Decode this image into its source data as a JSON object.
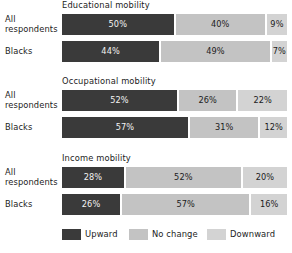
{
  "chart_data": {
    "type": "bar",
    "orientation": "horizontal",
    "stacked": true,
    "percent_stacked": true,
    "title": "",
    "xlabel": "",
    "ylabel": "",
    "xlim": [
      0,
      100
    ],
    "grid": false,
    "legend_position": "bottom",
    "series": [
      {
        "name": "Upward",
        "color": "#3a3a3a"
      },
      {
        "name": "No change",
        "color": "#c3c3c3"
      },
      {
        "name": "Downward",
        "color": "#d3d3d3"
      }
    ],
    "groups": [
      {
        "title": "Educational mobility",
        "categories": [
          "All respondents",
          "Blacks"
        ],
        "rows": [
          {
            "label_lines": [
              "All",
              "respondents"
            ],
            "values": [
              50,
              40,
              9
            ],
            "labels": [
              "50%",
              "40%",
              "9%"
            ]
          },
          {
            "label_lines": [
              "Blacks"
            ],
            "values": [
              44,
              49,
              7
            ],
            "labels": [
              "44%",
              "49%",
              "7%"
            ]
          }
        ]
      },
      {
        "title": "Occupational mobility",
        "categories": [
          "All respondents",
          "Blacks"
        ],
        "rows": [
          {
            "label_lines": [
              "All",
              "respondents"
            ],
            "values": [
              52,
              26,
              22
            ],
            "labels": [
              "52%",
              "26%",
              "22%"
            ]
          },
          {
            "label_lines": [
              "Blacks"
            ],
            "values": [
              57,
              31,
              12
            ],
            "labels": [
              "57%",
              "31%",
              "12%"
            ]
          }
        ]
      },
      {
        "title": "Income mobility",
        "categories": [
          "All respondents",
          "Blacks"
        ],
        "rows": [
          {
            "label_lines": [
              "All",
              "respondents"
            ],
            "values": [
              28,
              52,
              20
            ],
            "labels": [
              "28%",
              "52%",
              "20%"
            ]
          },
          {
            "label_lines": [
              "Blacks"
            ],
            "values": [
              26,
              57,
              16
            ],
            "labels": [
              "26%",
              "57%",
              "16%"
            ]
          }
        ]
      }
    ],
    "legend": [
      {
        "label": "Upward",
        "color": "#3a3a3a"
      },
      {
        "label": "No change",
        "color": "#c3c3c3"
      },
      {
        "label": "Downward",
        "color": "#d3d3d3"
      }
    ]
  },
  "layout": {
    "group_tops": [
      0,
      76,
      153
    ],
    "row_offsets": [
      14,
      41
    ],
    "track_left": 62,
    "track_width": 225,
    "legend_lefts": [
      62,
      129,
      207
    ]
  }
}
